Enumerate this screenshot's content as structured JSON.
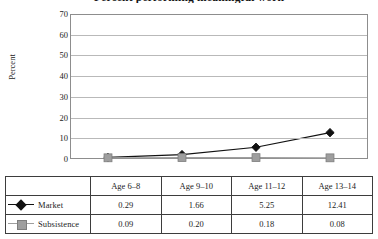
{
  "chart_data": {
    "type": "line",
    "title": "Percent performing meaningful work",
    "xlabel": "",
    "ylabel": "Percent",
    "categories": [
      "Age 6–8",
      "Age 9–10",
      "Age 11–12",
      "Age 13–14"
    ],
    "series": [
      {
        "name": "Market",
        "marker": "diamond",
        "color": "#111111",
        "values": [
          0.29,
          1.66,
          5.25,
          12.41
        ],
        "value_labels": [
          "0.29",
          "1.66",
          "5.25",
          "12.41"
        ]
      },
      {
        "name": "Subsistence",
        "marker": "square",
        "color": "#9e9e9e",
        "values": [
          0.09,
          0.2,
          0.18,
          0.08
        ],
        "value_labels": [
          "0.09",
          "0.20",
          "0.18",
          "0.08"
        ]
      }
    ],
    "ylim": [
      0,
      70
    ],
    "yticks": [
      0,
      10,
      20,
      30,
      40,
      50,
      60,
      70
    ],
    "ytick_labels": [
      "0",
      "10",
      "20",
      "30",
      "40",
      "50",
      "60",
      "70"
    ],
    "grid": "horizontal",
    "legend_position": "table-left-column"
  },
  "table": {
    "corner_label": "",
    "headers": [
      "Age 6–8",
      "Age 9–10",
      "Age 11–12",
      "Age 13–14"
    ],
    "rows": [
      {
        "label": "Market",
        "cells": [
          "0.29",
          "1.66",
          "5.25",
          "12.41"
        ]
      },
      {
        "label": "Subsistence",
        "cells": [
          "0.09",
          "0.20",
          "0.18",
          "0.08"
        ]
      }
    ]
  },
  "colors": {
    "market": "#111111",
    "subsistence": "#9e9e9e",
    "gridline": "#b9b9b9",
    "axis": "#8d8d8d",
    "table_border": "#3d3d3d"
  }
}
